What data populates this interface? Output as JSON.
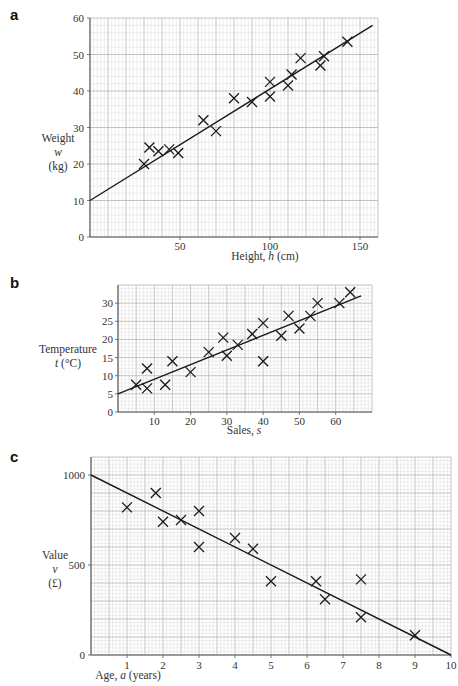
{
  "chart_data": [
    {
      "panel": "a",
      "type": "scatter",
      "title": "",
      "xlabel": "Height, h (cm)",
      "ylabel": [
        "Weight",
        "w",
        "(kg)"
      ],
      "xlim": [
        0,
        160
      ],
      "ylim": [
        0,
        60
      ],
      "xticks": [
        50,
        100,
        150
      ],
      "yticks": [
        0,
        10,
        20,
        30,
        40,
        50,
        60
      ],
      "grid": true,
      "legend": null,
      "marker": "x",
      "points": [
        [
          30,
          20
        ],
        [
          33,
          24.5
        ],
        [
          38,
          23.5
        ],
        [
          44,
          24
        ],
        [
          49,
          23
        ],
        [
          63,
          32
        ],
        [
          70,
          29
        ],
        [
          80,
          38
        ],
        [
          90,
          37
        ],
        [
          100,
          42.5
        ],
        [
          100,
          38.5
        ],
        [
          110,
          41.5
        ],
        [
          112,
          44.5
        ],
        [
          117,
          49
        ],
        [
          128,
          47
        ],
        [
          130,
          49.5
        ],
        [
          143,
          53.5
        ]
      ],
      "fit_line": {
        "from": [
          0,
          10
        ],
        "to": [
          157,
          58
        ]
      }
    },
    {
      "panel": "b",
      "type": "scatter",
      "title": "",
      "xlabel": "Sales, s",
      "ylabel": [
        "Temperature",
        "t (°C)"
      ],
      "xlim": [
        0,
        70
      ],
      "ylim": [
        0,
        35
      ],
      "xticks": [
        10,
        20,
        30,
        40,
        50,
        60
      ],
      "yticks": [
        0,
        5,
        10,
        15,
        20,
        25,
        30
      ],
      "grid": true,
      "legend": null,
      "marker": "x",
      "points": [
        [
          5,
          7.5
        ],
        [
          8,
          12
        ],
        [
          8,
          6.5
        ],
        [
          13,
          7.5
        ],
        [
          15,
          14
        ],
        [
          20,
          11
        ],
        [
          25,
          16.5
        ],
        [
          29,
          20.5
        ],
        [
          30,
          15.5
        ],
        [
          33,
          18.5
        ],
        [
          37,
          21.5
        ],
        [
          40,
          24.5
        ],
        [
          40,
          14
        ],
        [
          45,
          21
        ],
        [
          47,
          26.5
        ],
        [
          50,
          23
        ],
        [
          53,
          26.5
        ],
        [
          55,
          30
        ],
        [
          61,
          30
        ],
        [
          64,
          33
        ]
      ],
      "fit_line": {
        "from": [
          0,
          5
        ],
        "to": [
          67,
          32
        ]
      }
    },
    {
      "panel": "c",
      "type": "scatter",
      "title": "",
      "xlabel": "Age, a (years)",
      "ylabel": [
        "Value",
        "v",
        "(£)"
      ],
      "xlim": [
        0,
        10
      ],
      "ylim": [
        0,
        1100
      ],
      "xticks": [
        1,
        2,
        3,
        4,
        5,
        6,
        7,
        8,
        9,
        10
      ],
      "yticks": [
        0,
        500,
        1000
      ],
      "grid": true,
      "legend": null,
      "marker": "x",
      "points": [
        [
          1,
          820
        ],
        [
          1.8,
          900
        ],
        [
          2,
          740
        ],
        [
          2.5,
          750
        ],
        [
          3,
          800
        ],
        [
          3,
          600
        ],
        [
          4,
          650
        ],
        [
          4.5,
          590
        ],
        [
          5,
          410
        ],
        [
          6.25,
          410
        ],
        [
          6.5,
          310
        ],
        [
          7.5,
          420
        ],
        [
          7.5,
          210
        ],
        [
          9,
          110
        ]
      ],
      "fit_line": {
        "from": [
          0,
          1000
        ],
        "to": [
          10,
          0
        ]
      }
    }
  ],
  "panels": {
    "a": {
      "label": "a",
      "ylabel_line1": "Weight",
      "ylabel_line2": "w",
      "ylabel_line3": "(kg)",
      "xlabel_text": "Height, ",
      "xlabel_var": "h",
      "xlabel_unit": " (cm)"
    },
    "b": {
      "label": "b",
      "ylabel_line1": "Temperature",
      "ylabel_line2_var": "t",
      "ylabel_line2_unit": " (°C)",
      "xlabel_text": "Sales, ",
      "xlabel_var": "s"
    },
    "c": {
      "label": "c",
      "ylabel_line1": "Value",
      "ylabel_line2": "v",
      "ylabel_line3": "(£)",
      "xlabel_text": "Age, ",
      "xlabel_var": "a",
      "xlabel_unit": " (years)"
    }
  },
  "style": {
    "grid_minor": "#d9d9d9",
    "grid_major": "#b5b5b5",
    "axis": "#555555",
    "ink": "#1a1a1a"
  }
}
